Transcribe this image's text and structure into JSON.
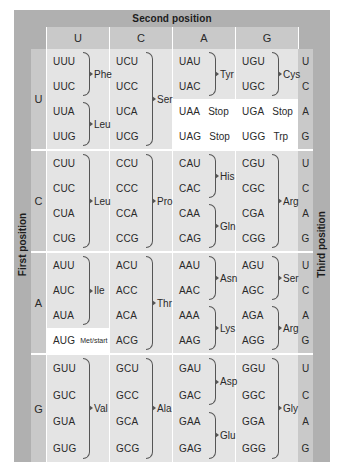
{
  "banners": {
    "top": "Second position",
    "left": "First position",
    "right": "Third position"
  },
  "column_headers": [
    "U",
    "C",
    "A",
    "G"
  ],
  "third_position_labels": [
    "U",
    "C",
    "A",
    "G"
  ],
  "blocks": [
    {
      "first": "U",
      "columns": [
        {
          "second": "U",
          "rows": [
            {
              "codon": "UUU"
            },
            {
              "codon": "UUC"
            },
            {
              "codon": "UUA"
            },
            {
              "codon": "UUG"
            }
          ],
          "groups": [
            {
              "aa": "Phe",
              "start": 0,
              "span": 2
            },
            {
              "aa": "Leu",
              "start": 2,
              "span": 2
            }
          ]
        },
        {
          "second": "C",
          "rows": [
            {
              "codon": "UCU"
            },
            {
              "codon": "UCC"
            },
            {
              "codon": "UCA"
            },
            {
              "codon": "UCG"
            }
          ],
          "groups": [
            {
              "aa": "Ser",
              "start": 0,
              "span": 4
            }
          ]
        },
        {
          "second": "A",
          "rows": [
            {
              "codon": "UAU"
            },
            {
              "codon": "UAC"
            },
            {
              "codon": "UAA",
              "aa_inline": "Stop",
              "highlight": true
            },
            {
              "codon": "UAG",
              "aa_inline": "Stop",
              "highlight": true
            }
          ],
          "groups": [
            {
              "aa": "Tyr",
              "start": 0,
              "span": 2
            }
          ]
        },
        {
          "second": "G",
          "rows": [
            {
              "codon": "UGU"
            },
            {
              "codon": "UGC"
            },
            {
              "codon": "UGA",
              "aa_inline": "Stop",
              "highlight": true
            },
            {
              "codon": "UGG",
              "aa_inline": "Trp",
              "highlight": true
            }
          ],
          "groups": [
            {
              "aa": "Cys",
              "start": 0,
              "span": 2
            }
          ]
        }
      ]
    },
    {
      "first": "C",
      "columns": [
        {
          "second": "U",
          "rows": [
            {
              "codon": "CUU"
            },
            {
              "codon": "CUC"
            },
            {
              "codon": "CUA"
            },
            {
              "codon": "CUG"
            }
          ],
          "groups": [
            {
              "aa": "Leu",
              "start": 0,
              "span": 4
            }
          ]
        },
        {
          "second": "C",
          "rows": [
            {
              "codon": "CCU"
            },
            {
              "codon": "CCC"
            },
            {
              "codon": "CCA"
            },
            {
              "codon": "CCG"
            }
          ],
          "groups": [
            {
              "aa": "Pro",
              "start": 0,
              "span": 4
            }
          ]
        },
        {
          "second": "A",
          "rows": [
            {
              "codon": "CAU"
            },
            {
              "codon": "CAC"
            },
            {
              "codon": "CAA"
            },
            {
              "codon": "CAG"
            }
          ],
          "groups": [
            {
              "aa": "His",
              "start": 0,
              "span": 2
            },
            {
              "aa": "Gln",
              "start": 2,
              "span": 2
            }
          ]
        },
        {
          "second": "G",
          "rows": [
            {
              "codon": "CGU"
            },
            {
              "codon": "CGC"
            },
            {
              "codon": "CGA"
            },
            {
              "codon": "CGG"
            }
          ],
          "groups": [
            {
              "aa": "Arg",
              "start": 0,
              "span": 4
            }
          ]
        }
      ]
    },
    {
      "first": "A",
      "columns": [
        {
          "second": "U",
          "rows": [
            {
              "codon": "AUU"
            },
            {
              "codon": "AUC"
            },
            {
              "codon": "AUA"
            },
            {
              "codon": "AUG",
              "aa_small": "Met/start",
              "highlight": true
            }
          ],
          "groups": [
            {
              "aa": "Ile",
              "start": 0,
              "span": 3
            }
          ]
        },
        {
          "second": "C",
          "rows": [
            {
              "codon": "ACU"
            },
            {
              "codon": "ACC"
            },
            {
              "codon": "ACA"
            },
            {
              "codon": "ACG"
            }
          ],
          "groups": [
            {
              "aa": "Thr",
              "start": 0,
              "span": 4
            }
          ]
        },
        {
          "second": "A",
          "rows": [
            {
              "codon": "AAU"
            },
            {
              "codon": "AAC"
            },
            {
              "codon": "AAA"
            },
            {
              "codon": "AAG"
            }
          ],
          "groups": [
            {
              "aa": "Asn",
              "start": 0,
              "span": 2
            },
            {
              "aa": "Lys",
              "start": 2,
              "span": 2
            }
          ]
        },
        {
          "second": "G",
          "rows": [
            {
              "codon": "AGU"
            },
            {
              "codon": "AGC"
            },
            {
              "codon": "AGA"
            },
            {
              "codon": "AGG"
            }
          ],
          "groups": [
            {
              "aa": "Ser",
              "start": 0,
              "span": 2
            },
            {
              "aa": "Arg",
              "start": 2,
              "span": 2
            }
          ]
        }
      ]
    },
    {
      "first": "G",
      "columns": [
        {
          "second": "U",
          "rows": [
            {
              "codon": "GUU"
            },
            {
              "codon": "GUC"
            },
            {
              "codon": "GUA"
            },
            {
              "codon": "GUG"
            }
          ],
          "groups": [
            {
              "aa": "Val",
              "start": 0,
              "span": 4
            }
          ]
        },
        {
          "second": "C",
          "rows": [
            {
              "codon": "GCU"
            },
            {
              "codon": "GCC"
            },
            {
              "codon": "GCA"
            },
            {
              "codon": "GCG"
            }
          ],
          "groups": [
            {
              "aa": "Ala",
              "start": 0,
              "span": 4
            }
          ]
        },
        {
          "second": "A",
          "rows": [
            {
              "codon": "GAU"
            },
            {
              "codon": "GAC"
            },
            {
              "codon": "GAA"
            },
            {
              "codon": "GAG"
            }
          ],
          "groups": [
            {
              "aa": "Asp",
              "start": 0,
              "span": 2
            },
            {
              "aa": "Glu",
              "start": 2,
              "span": 2
            }
          ]
        },
        {
          "second": "G",
          "rows": [
            {
              "codon": "GGU"
            },
            {
              "codon": "GGC"
            },
            {
              "codon": "GGA"
            },
            {
              "codon": "GGG"
            }
          ],
          "groups": [
            {
              "aa": "Gly",
              "start": 0,
              "span": 4
            }
          ]
        }
      ]
    }
  ],
  "colors": {
    "frame": "#b0b0b0",
    "header_strip": "#c9c9c9",
    "cell_bg": "#e4e4e4",
    "highlight": "#ffffff",
    "text": "#2a2a2a"
  }
}
